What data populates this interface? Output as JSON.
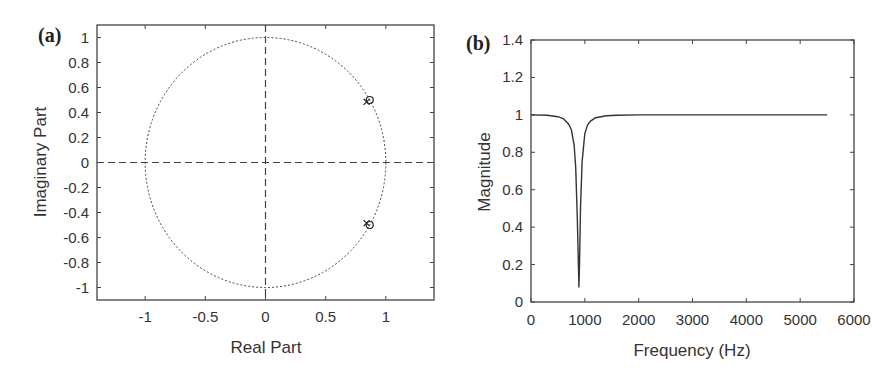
{
  "chart_data": [
    {
      "type": "scatter",
      "panel_label": "(a)",
      "title": "",
      "xlabel": "Real Part",
      "ylabel": "Imaginary Part",
      "xlim": [
        -1.4,
        1.4
      ],
      "ylim": [
        -1.1,
        1.1
      ],
      "xticks": [
        -1,
        -0.5,
        0,
        0.5,
        1
      ],
      "xtick_labels": [
        "-1",
        "-0.5",
        "0",
        "0.5",
        "1"
      ],
      "yticks": [
        1,
        0.8,
        0.6,
        0.4,
        0.2,
        0,
        -0.2,
        -0.4,
        -0.6,
        -0.8,
        -1
      ],
      "ytick_labels": [
        "1",
        "0.8",
        "0.6",
        "0.4",
        "0.2",
        "0",
        "-0.2",
        "-0.4",
        "-0.6",
        "-0.8",
        "-1"
      ],
      "grid": false,
      "unit_circle": {
        "radius": 1,
        "style": "dotted"
      },
      "axes_lines": {
        "style": "dashed"
      },
      "series": [
        {
          "name": "zeros",
          "marker": "o",
          "points": [
            [
              0.866,
              0.5
            ],
            [
              0.866,
              -0.5
            ]
          ]
        },
        {
          "name": "poles",
          "marker": "x",
          "points": [
            [
              0.84,
              0.485
            ],
            [
              0.84,
              -0.485
            ]
          ]
        }
      ]
    },
    {
      "type": "line",
      "panel_label": "(b)",
      "title": "",
      "xlabel": "Frequency (Hz)",
      "ylabel": "Magnitude",
      "xlim": [
        0,
        6000
      ],
      "ylim": [
        0,
        1.4
      ],
      "xticks": [
        0,
        1000,
        2000,
        3000,
        4000,
        5000,
        6000
      ],
      "xtick_labels": [
        "0",
        "1000",
        "2000",
        "3000",
        "4000",
        "5000",
        "6000"
      ],
      "yticks": [
        0,
        0.2,
        0.4,
        0.6,
        0.8,
        1,
        1.2,
        1.4
      ],
      "ytick_labels": [
        "0",
        "0.2",
        "0.4",
        "0.6",
        "0.8",
        "1",
        "1.2",
        "1.4"
      ],
      "grid": false,
      "series": [
        {
          "name": "magnitude response",
          "notch_frequency_hz": 890,
          "notch_min": 0.08,
          "x": [
            0,
            300,
            500,
            600,
            700,
            750,
            800,
            830,
            860,
            880,
            890,
            900,
            920,
            950,
            1000,
            1050,
            1100,
            1200,
            1400,
            1600,
            2000,
            3000,
            4000,
            5000,
            5500
          ],
          "values": [
            1.0,
            0.998,
            0.99,
            0.98,
            0.95,
            0.92,
            0.84,
            0.72,
            0.45,
            0.2,
            0.08,
            0.2,
            0.5,
            0.75,
            0.9,
            0.945,
            0.965,
            0.985,
            0.995,
            0.998,
            1.0,
            1.0,
            1.0,
            1.0,
            1.0
          ]
        }
      ]
    }
  ]
}
